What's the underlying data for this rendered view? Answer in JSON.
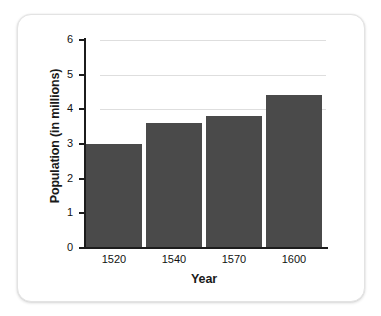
{
  "chart_data": {
    "type": "bar",
    "title": "",
    "subtitle": "",
    "xlabel": "Year",
    "ylabel": "Population (in millions)",
    "categories": [
      "1520",
      "1540",
      "1570",
      "1600"
    ],
    "values": [
      3.0,
      3.6,
      3.8,
      4.4
    ],
    "series": [
      {
        "name": "Population",
        "values": [
          3.0,
          3.6,
          3.8,
          4.4
        ]
      }
    ],
    "ylim": [
      0,
      6
    ],
    "xlim": [
      0,
      4
    ],
    "y_ticks": [
      "0",
      "1",
      "2",
      "3",
      "4",
      "5",
      "6"
    ],
    "y_tick_values": [
      0,
      1,
      2,
      3,
      4,
      5,
      6
    ],
    "gridlines": {
      "horizontal": true,
      "vertical": false,
      "at_values": [
        4,
        5,
        6
      ],
      "color": "#d8d8d8"
    },
    "legend": {
      "visible": false,
      "position": "none",
      "entries": []
    },
    "colors": {
      "bar": "#4a4a4a",
      "axis": "#1c1c1c",
      "text": "#111111",
      "title_text": "#1a1a1a",
      "background": "#ffffff",
      "card_border": "#e3e3e3",
      "gridline": "#d8d8d8"
    },
    "annotations": []
  },
  "card": {
    "name": "chart-card"
  }
}
